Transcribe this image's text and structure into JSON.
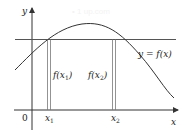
{
  "watermark": "• 1 up.com",
  "axes": {
    "x_label": "x",
    "y_label": "y",
    "origin_label": "0"
  },
  "curve": {
    "label": "y = f(x)",
    "color": "#333333"
  },
  "horizontal_line": {
    "color": "#555555"
  },
  "points": [
    {
      "tick_label": "x",
      "subscript": "1",
      "value_label": "f(x",
      "value_sub": "1",
      "value_close": ")"
    },
    {
      "tick_label": "x",
      "subscript": "2",
      "value_label": "f(x",
      "value_sub": "2",
      "value_close": ")"
    }
  ],
  "colors": {
    "axis": "#333333",
    "line": "#555555",
    "bar": "#777777",
    "text": "#222222"
  }
}
